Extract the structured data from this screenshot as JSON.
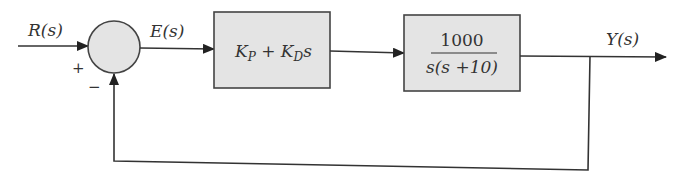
{
  "diagram": {
    "type": "feedback-control-block-diagram",
    "colors": {
      "line": "#333333",
      "block_fill": "#e4e4e4",
      "junction_fill": "#e4e4e4",
      "background": "#ffffff"
    },
    "signals": {
      "input": "R(s)",
      "error": "E(s)",
      "output": "Y(s)"
    },
    "summing_junction": {
      "plus_sign": "+",
      "minus_sign": "−"
    },
    "blocks": [
      {
        "id": "controller",
        "label_main_1": "K",
        "label_sub_1": "P",
        "label_plus": " + ",
        "label_main_2": "K",
        "label_sub_2": "D",
        "label_tail": "s"
      },
      {
        "id": "plant",
        "numerator": "1000",
        "denominator": "s(s +10)"
      }
    ],
    "feedback": "unity negative feedback"
  }
}
